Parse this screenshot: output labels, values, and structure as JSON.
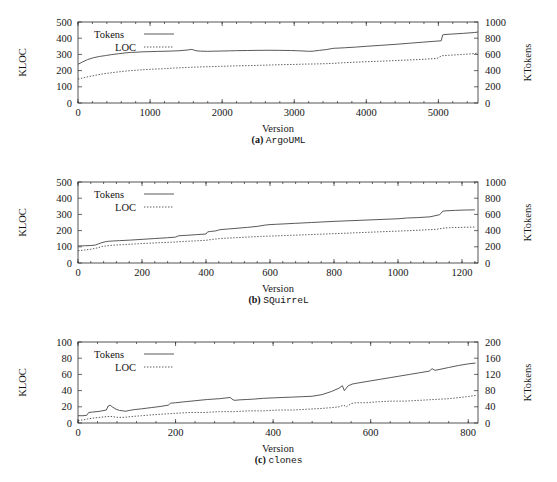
{
  "figure": {
    "axis_titles": {
      "x": "Version",
      "y_left": "KLOC",
      "y_right": "KTokens"
    },
    "legend": {
      "tokens": "Tokens",
      "loc": "LOC"
    },
    "captions": {
      "a_label": "(a)",
      "a_name": "ArgoUML",
      "b_label": "(b)",
      "b_name": "SQuirreL",
      "c_label": "(c)",
      "c_name": "clones"
    },
    "colors": {
      "line": "#3b3b3b",
      "frame": "#2a2a2a",
      "text": "#151515",
      "background": "#ffffff"
    }
  },
  "chart_data": [
    {
      "type": "line",
      "title": "(a) ArgoUML",
      "xlabel": "Version",
      "ylabel": "KLOC",
      "y2label": "KTokens",
      "xlim": [
        0,
        5550
      ],
      "ylim": [
        0,
        500
      ],
      "y2lim": [
        0,
        1000
      ],
      "xticks": [
        0,
        1000,
        2000,
        3000,
        4000,
        5000
      ],
      "yticks": [
        0,
        100,
        200,
        300,
        400,
        500
      ],
      "y2ticks": [
        0,
        200,
        400,
        600,
        800,
        1000
      ],
      "grid": false,
      "legend_position": "top-left",
      "series": [
        {
          "name": "Tokens",
          "style": "solid",
          "axis": "right",
          "units": "KTokens",
          "x": [
            0,
            60,
            130,
            220,
            300,
            380,
            470,
            560,
            650,
            740,
            830,
            900,
            1000,
            1100,
            1250,
            1400,
            1530,
            1570,
            1600,
            1640,
            1700,
            1800,
            1900,
            2000,
            2100,
            2200,
            2350,
            2500,
            2650,
            2800,
            2950,
            3050,
            3150,
            3200,
            3260,
            3350,
            3450,
            3520,
            3560,
            3620,
            3700,
            3850,
            4000,
            4200,
            4400,
            4600,
            4800,
            4950,
            5040,
            5060,
            5080,
            5200,
            5350,
            5500,
            5550
          ],
          "y": [
            478,
            505,
            535,
            560,
            575,
            585,
            598,
            608,
            618,
            625,
            628,
            632,
            634,
            637,
            640,
            645,
            655,
            662,
            656,
            645,
            640,
            638,
            640,
            642,
            644,
            646,
            648,
            650,
            651,
            650,
            648,
            645,
            641,
            638,
            640,
            650,
            660,
            672,
            676,
            678,
            682,
            690,
            700,
            712,
            724,
            738,
            752,
            762,
            768,
            840,
            845,
            852,
            860,
            870,
            876
          ]
        },
        {
          "name": "LOC",
          "style": "dotted",
          "axis": "left",
          "units": "KLOC",
          "x": [
            0,
            70,
            150,
            250,
            350,
            450,
            560,
            680,
            800,
            920,
            1050,
            1200,
            1350,
            1500,
            1650,
            1800,
            1950,
            2100,
            2250,
            2400,
            2550,
            2700,
            2850,
            3000,
            3150,
            3300,
            3450,
            3550,
            3700,
            3850,
            4000,
            4200,
            4400,
            4600,
            4800,
            4980,
            5050,
            5200,
            5350,
            5500,
            5550
          ],
          "y": [
            147,
            155,
            163,
            172,
            180,
            186,
            192,
            198,
            202,
            206,
            209,
            212,
            216,
            219,
            222,
            224,
            226,
            228,
            230,
            231,
            233,
            235,
            237,
            238,
            240,
            241,
            243,
            245,
            249,
            252,
            255,
            258,
            262,
            266,
            270,
            275,
            292,
            296,
            300,
            305,
            308
          ]
        }
      ]
    },
    {
      "type": "line",
      "title": "(b) SQuirreL",
      "xlabel": "Version",
      "ylabel": "KLOC",
      "y2label": "KTokens",
      "xlim": [
        0,
        1250
      ],
      "ylim": [
        0,
        500
      ],
      "y2lim": [
        0,
        1000
      ],
      "xticks": [
        0,
        200,
        400,
        600,
        800,
        1000,
        1200
      ],
      "yticks": [
        0,
        100,
        200,
        300,
        400,
        500
      ],
      "y2ticks": [
        0,
        200,
        400,
        600,
        800,
        1000
      ],
      "grid": false,
      "legend_position": "top-left",
      "series": [
        {
          "name": "Tokens",
          "style": "solid",
          "axis": "right",
          "units": "KTokens",
          "x": [
            0,
            20,
            40,
            55,
            65,
            75,
            85,
            95,
            110,
            130,
            160,
            200,
            240,
            280,
            305,
            315,
            340,
            370,
            400,
            405,
            415,
            430,
            440,
            450,
            470,
            500,
            530,
            560,
            585,
            600,
            620,
            650,
            680,
            700,
            730,
            760,
            800,
            850,
            900,
            950,
            1000,
            1030,
            1060,
            1100,
            1130,
            1140,
            1150,
            1180,
            1210,
            1240
          ],
          "y": [
            210,
            213,
            216,
            222,
            238,
            252,
            262,
            268,
            272,
            276,
            282,
            292,
            302,
            312,
            320,
            336,
            342,
            350,
            358,
            384,
            390,
            396,
            408,
            414,
            420,
            430,
            440,
            452,
            468,
            474,
            478,
            484,
            490,
            494,
            500,
            506,
            514,
            522,
            530,
            538,
            546,
            556,
            560,
            570,
            596,
            640,
            644,
            650,
            654,
            656
          ]
        },
        {
          "name": "LOC",
          "style": "dotted",
          "axis": "left",
          "units": "KLOC",
          "x": [
            0,
            20,
            40,
            60,
            75,
            90,
            110,
            140,
            180,
            220,
            260,
            300,
            330,
            360,
            400,
            420,
            450,
            490,
            530,
            570,
            600,
            640,
            680,
            720,
            760,
            800,
            850,
            900,
            950,
            1000,
            1040,
            1080,
            1120,
            1145,
            1160,
            1200,
            1240
          ],
          "y": [
            76,
            80,
            85,
            93,
            102,
            106,
            110,
            113,
            118,
            122,
            126,
            129,
            133,
            136,
            140,
            146,
            152,
            156,
            160,
            164,
            166,
            169,
            172,
            175,
            178,
            181,
            185,
            189,
            193,
            197,
            200,
            204,
            208,
            216,
            218,
            220,
            222
          ]
        }
      ]
    },
    {
      "type": "line",
      "title": "(c) clones",
      "xlabel": "Version",
      "ylabel": "KLOC",
      "y2label": "KTokens",
      "xlim": [
        0,
        820
      ],
      "ylim": [
        0,
        100
      ],
      "y2lim": [
        0,
        200
      ],
      "xticks": [
        0,
        200,
        400,
        600,
        800
      ],
      "yticks": [
        0,
        20,
        40,
        60,
        80,
        100
      ],
      "y2ticks": [
        0,
        40,
        80,
        120,
        160,
        200
      ],
      "grid": false,
      "legend_position": "top-left",
      "series": [
        {
          "name": "Tokens",
          "style": "solid",
          "axis": "right",
          "units": "KTokens",
          "x": [
            0,
            10,
            18,
            22,
            30,
            45,
            58,
            62,
            66,
            70,
            78,
            85,
            92,
            98,
            105,
            115,
            130,
            150,
            170,
            185,
            190,
            200,
            215,
            240,
            265,
            290,
            312,
            318,
            322,
            330,
            345,
            360,
            380,
            400,
            420,
            440,
            460,
            480,
            500,
            520,
            535,
            542,
            546,
            550,
            554,
            558,
            562,
            570,
            580,
            600,
            620,
            640,
            660,
            680,
            700,
            720,
            726,
            732,
            740,
            760,
            780,
            800,
            815
          ],
          "y": [
            18,
            18,
            19,
            26,
            27,
            29,
            32,
            42,
            44,
            40,
            34,
            31,
            30,
            29,
            31,
            33,
            35,
            38,
            41,
            44,
            49,
            50,
            52,
            55,
            58,
            60,
            63,
            57,
            56,
            57,
            58,
            59,
            61,
            62,
            63,
            64,
            65,
            66,
            70,
            78,
            86,
            92,
            80,
            86,
            92,
            94,
            96,
            98,
            100,
            104,
            108,
            112,
            116,
            120,
            124,
            128,
            134,
            130,
            132,
            137,
            142,
            146,
            148
          ]
        },
        {
          "name": "LOC",
          "style": "dotted",
          "axis": "left",
          "units": "KLOC",
          "x": [
            0,
            12,
            20,
            30,
            45,
            60,
            70,
            80,
            95,
            110,
            130,
            150,
            175,
            200,
            230,
            260,
            290,
            320,
            350,
            380,
            410,
            440,
            470,
            500,
            520,
            535,
            545,
            550,
            560,
            570,
            590,
            610,
            640,
            670,
            700,
            730,
            760,
            790,
            815
          ],
          "y": [
            3,
            4,
            5,
            6,
            7,
            8,
            8,
            7,
            7,
            8,
            9,
            10,
            11,
            12,
            13,
            13,
            14,
            14,
            15,
            15,
            16,
            16,
            17,
            18,
            19,
            20,
            22,
            20,
            24,
            25,
            25,
            26,
            27,
            27,
            28,
            29,
            30,
            32,
            34
          ]
        }
      ]
    }
  ]
}
